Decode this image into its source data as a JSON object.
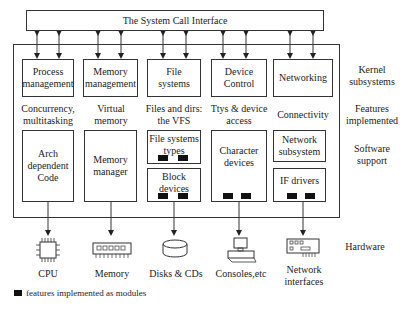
{
  "syscall": {
    "label": "The System Call Interface"
  },
  "kernel_subsystems": [
    {
      "id": "process",
      "label": "Process management",
      "lines": [
        "Process",
        "management"
      ]
    },
    {
      "id": "memory",
      "label": "Memory management",
      "lines": [
        "Memory",
        "management"
      ]
    },
    {
      "id": "filesystems",
      "label": "File systems",
      "lines": [
        "File",
        "systems"
      ]
    },
    {
      "id": "device",
      "label": "Device Control",
      "lines": [
        "Device",
        "Control"
      ]
    },
    {
      "id": "networking",
      "label": "Networking",
      "lines": [
        "Networking"
      ]
    }
  ],
  "features": [
    {
      "lines": [
        "Concurrency,",
        "multitasking"
      ]
    },
    {
      "lines": [
        "Virtual",
        "memory"
      ]
    },
    {
      "lines": [
        "Files and dirs:",
        "the VFS"
      ]
    },
    {
      "lines": [
        "Ttys & device",
        "access"
      ]
    },
    {
      "lines": [
        "Connectivity"
      ]
    }
  ],
  "software_support": {
    "arch": {
      "lines": [
        "Arch",
        "dependent",
        "Code"
      ]
    },
    "memmgr": {
      "lines": [
        "Memory",
        "manager"
      ]
    },
    "fstypes": {
      "lines": [
        "File systems",
        "types"
      ]
    },
    "block": {
      "lines": [
        "Block",
        "devices"
      ]
    },
    "chardev": {
      "lines": [
        "Character",
        "devices"
      ]
    },
    "netsub": {
      "lines": [
        "Network",
        "subsystem"
      ]
    },
    "ifdrivers": {
      "lines": [
        "IF drivers"
      ]
    }
  },
  "hardware": [
    {
      "icon": "cpu-icon",
      "lines": [
        "CPU"
      ]
    },
    {
      "icon": "memory-chip-icon",
      "lines": [
        "Memory"
      ]
    },
    {
      "icon": "disk-icon",
      "lines": [
        "Disks & CDs"
      ]
    },
    {
      "icon": "console-icon",
      "lines": [
        "Consoles,etc"
      ]
    },
    {
      "icon": "network-card-icon",
      "lines": [
        "Network",
        "interfaces"
      ]
    }
  ],
  "side_labels": {
    "kernel": [
      "Kernel",
      "subsystems"
    ],
    "features": [
      "Features",
      "implemented"
    ],
    "software": [
      "Software",
      "support"
    ],
    "hardware": [
      "Hardware"
    ]
  },
  "legend": {
    "text": "features implemented as modules"
  }
}
